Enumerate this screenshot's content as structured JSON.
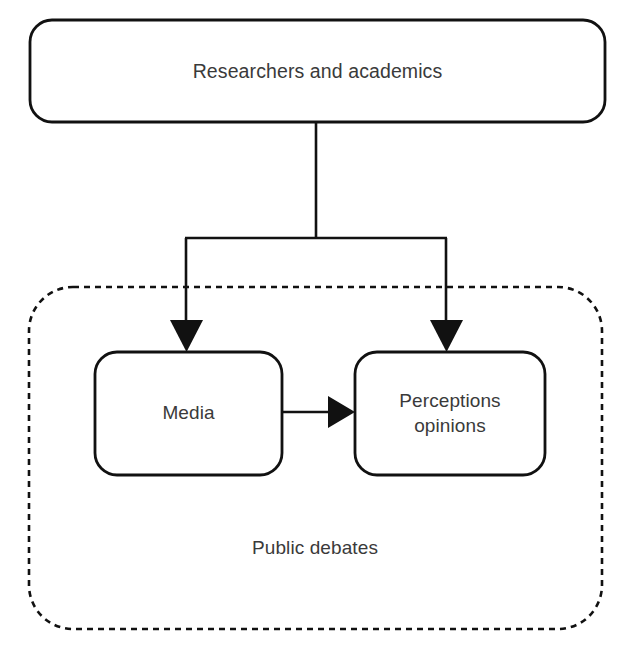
{
  "diagram": {
    "canvas": {
      "width": 623,
      "height": 649,
      "background": "#ffffff"
    },
    "style": {
      "stroke_color": "#111111",
      "text_color": "#3a3a3a",
      "fill_color": "#ffffff",
      "solid_stroke_width": 2.6,
      "dashed_stroke_width": 2.6,
      "dash_pattern": "6 5"
    },
    "nodes": [
      {
        "id": "researchers",
        "label": "Researchers and academics",
        "shape": "rounded-rectangle",
        "border": "solid",
        "x": 30,
        "y": 20,
        "width": 575,
        "height": 102,
        "corner_radius": 22
      },
      {
        "id": "media",
        "label": "Media",
        "shape": "rounded-rectangle",
        "border": "solid",
        "x": 95,
        "y": 352,
        "width": 187,
        "height": 123,
        "corner_radius": 22
      },
      {
        "id": "perceptions",
        "label": "Perceptions\nopinions",
        "shape": "rounded-rectangle",
        "border": "solid",
        "x": 355,
        "y": 352,
        "width": 190,
        "height": 123,
        "corner_radius": 22
      }
    ],
    "containers": [
      {
        "id": "public-debates",
        "label": "Public debates",
        "shape": "rounded-rectangle",
        "border": "dashed",
        "x": 29,
        "y": 287,
        "width": 573,
        "height": 342,
        "corner_radius": 44,
        "label_position": "bottom-center",
        "contains": [
          "media",
          "perceptions"
        ]
      }
    ],
    "edges": [
      {
        "id": "researchers-to-media",
        "from": "researchers",
        "to": "media",
        "arrowhead": "filled-triangle",
        "routing": "orthogonal-fork-left"
      },
      {
        "id": "researchers-to-perceptions",
        "from": "researchers",
        "to": "perceptions",
        "arrowhead": "filled-triangle",
        "routing": "orthogonal-fork-right"
      },
      {
        "id": "media-to-perceptions",
        "from": "media",
        "to": "perceptions",
        "arrowhead": "filled-triangle",
        "routing": "straight-horizontal"
      }
    ]
  }
}
